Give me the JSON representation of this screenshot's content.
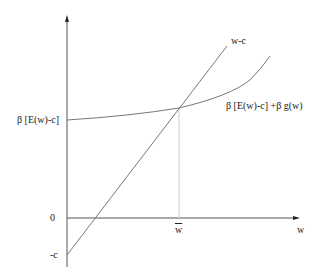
{
  "diagram": {
    "type": "economics-diagram",
    "colors": {
      "axis": "#555555",
      "line": "#777777",
      "curve": "#777777",
      "guide": "#cccccc",
      "text": "#222222"
    },
    "axes": {
      "x_label": "w",
      "y_ticks": [
        {
          "label": "β [E(w)-c]",
          "position": "curve-intercept"
        },
        {
          "label": "0",
          "position": "origin"
        },
        {
          "label": "-c",
          "position": "line-intercept"
        }
      ],
      "x_ticks": [
        {
          "label": "w",
          "overline": true,
          "meaning": "w-bar, intersection point"
        }
      ]
    },
    "curves": [
      {
        "name": "w-c",
        "kind": "straight-line",
        "label": "w-c"
      },
      {
        "name": "beta-expected",
        "kind": "convex-curve",
        "label": "β [E(w)-c]  +β g(w)"
      }
    ],
    "intersection_label": "w"
  }
}
